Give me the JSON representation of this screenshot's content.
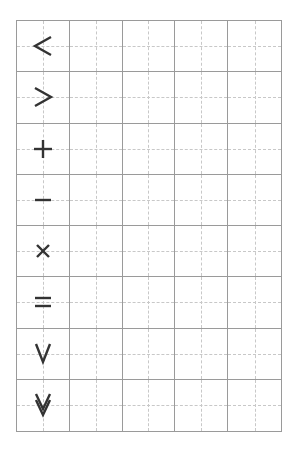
{
  "worksheet": {
    "rows": 8,
    "columns": 5,
    "symbols": [
      {
        "char": "<",
        "name": "less-than"
      },
      {
        "char": ">",
        "name": "greater-than"
      },
      {
        "char": "+",
        "name": "plus"
      },
      {
        "char": "−",
        "name": "minus"
      },
      {
        "char": "×",
        "name": "multiply"
      },
      {
        "char": "=",
        "name": "equals"
      },
      {
        "char": "∨",
        "name": "v-chevron"
      },
      {
        "char": "⩔",
        "name": "double-v-chevron"
      }
    ],
    "colors": {
      "grid_line": "#9a9a9a",
      "guide_line": "#c8c8c8",
      "symbol": "#333333",
      "background": "#ffffff"
    }
  }
}
